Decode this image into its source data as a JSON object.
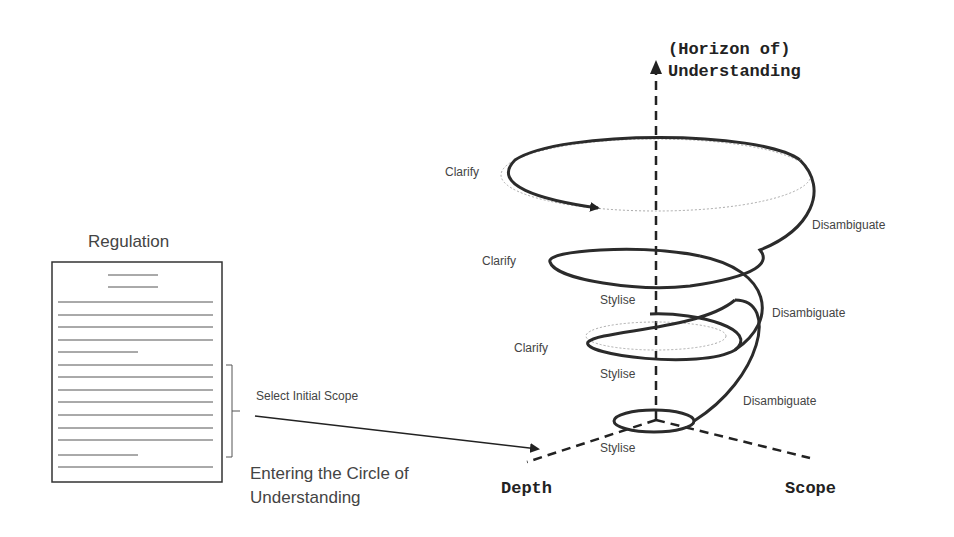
{
  "document": {
    "title": "Regulation",
    "selection_label": "Select Initial Scope",
    "entering_label_line1": "Entering the Circle of",
    "entering_label_line2": "Understanding"
  },
  "axes": {
    "vertical_line1": "(Horizon of)",
    "vertical_line2": "Understanding",
    "depth": "Depth",
    "scope": "Scope"
  },
  "spiral": {
    "clarify_labels": [
      "Clarify",
      "Clarify",
      "Clarify"
    ],
    "disambiguate_labels": [
      "Disambiguate",
      "Disambiguate",
      "Disambiguate"
    ],
    "stylise_labels": [
      "Stylise",
      "Stylise",
      "Stylise"
    ]
  }
}
